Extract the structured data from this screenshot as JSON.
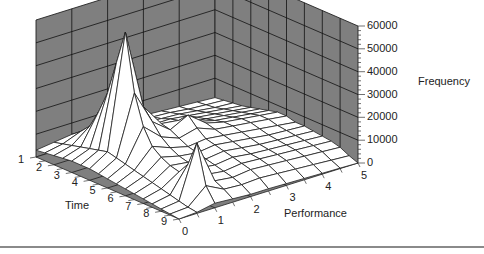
{
  "chart_data": {
    "type": "surface3d",
    "title": "",
    "xlabel": "Performance",
    "ylabel": "Time",
    "zlabel": "Frequency",
    "x_ticks": [
      "0",
      "1",
      "2",
      "3",
      "4",
      "5"
    ],
    "y_ticks": [
      "1",
      "2",
      "3",
      "4",
      "5",
      "6",
      "7",
      "8",
      "9"
    ],
    "z_ticks": [
      "0",
      "10000",
      "20000",
      "30000",
      "40000",
      "50000",
      "60000"
    ],
    "zlim": [
      0,
      60000
    ],
    "grid": true,
    "wall_color": "#7f7f7f",
    "surface_color": "#ffffff",
    "x_resolution": 11,
    "y_resolution": 17,
    "values_description": "rows = Time 1..9 (step 0.5), cols = Performance 0..5 (step 0.5); Frequency",
    "values": [
      [
        3000,
        4000,
        5000,
        4500,
        4000,
        4000,
        3500,
        3000,
        2500,
        2000,
        1500
      ],
      [
        3500,
        5000,
        8000,
        6000,
        5000,
        5000,
        4500,
        4000,
        3000,
        2500,
        2000
      ],
      [
        4000,
        6000,
        12000,
        8000,
        6000,
        6000,
        5500,
        5000,
        4000,
        3000,
        2500
      ],
      [
        4500,
        7000,
        20000,
        10000,
        7000,
        7000,
        7000,
        6000,
        5000,
        4000,
        3000
      ],
      [
        5000,
        8000,
        30000,
        14000,
        9000,
        9000,
        8000,
        7000,
        6000,
        5000,
        4000
      ],
      [
        5000,
        9000,
        45000,
        20000,
        12000,
        10000,
        9000,
        8000,
        7000,
        6000,
        5000
      ],
      [
        5000,
        10000,
        60000,
        25000,
        15000,
        14000,
        11000,
        9000,
        8000,
        7000,
        6000
      ],
      [
        4500,
        9000,
        35000,
        20000,
        14000,
        18000,
        12000,
        10000,
        9000,
        8000,
        7000
      ],
      [
        4000,
        8000,
        22000,
        15000,
        12000,
        14000,
        11000,
        10000,
        9000,
        8000,
        7000
      ],
      [
        3500,
        7000,
        15000,
        12000,
        10000,
        11000,
        10000,
        9000,
        8000,
        7000,
        6000
      ],
      [
        3000,
        6000,
        12000,
        10000,
        9000,
        10000,
        9000,
        8000,
        7000,
        6500,
        6000
      ],
      [
        2500,
        5000,
        10000,
        9000,
        8000,
        9000,
        8000,
        7000,
        6500,
        6000,
        5500
      ],
      [
        2000,
        4000,
        9000,
        8000,
        7000,
        8000,
        7000,
        6500,
        6000,
        5500,
        5000
      ],
      [
        1500,
        3000,
        14000,
        7000,
        6000,
        7000,
        6500,
        6000,
        5500,
        5000,
        4500
      ],
      [
        1000,
        2000,
        25000,
        6000,
        5000,
        6000,
        5500,
        5000,
        4500,
        4000,
        3500
      ],
      [
        500,
        1000,
        8000,
        4000,
        3500,
        4000,
        3500,
        3000,
        2500,
        2000,
        1500
      ],
      [
        0,
        500,
        2000,
        1500,
        1000,
        1000,
        800,
        600,
        400,
        200,
        0
      ]
    ]
  }
}
